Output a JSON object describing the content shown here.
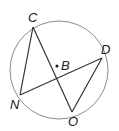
{
  "diagram": {
    "type": "circle-inscribed-chords",
    "circle": {
      "cx": 59,
      "cy": 70,
      "r": 49,
      "stroke": "#888888"
    },
    "center": {
      "label": "B",
      "x": 57,
      "y": 66
    },
    "points": [
      {
        "label": "C",
        "x": 33,
        "y": 27
      },
      {
        "label": "D",
        "x": 102,
        "y": 58
      },
      {
        "label": "N",
        "x": 20,
        "y": 95
      },
      {
        "label": "O",
        "x": 72,
        "y": 112
      }
    ],
    "segments": [
      [
        "C",
        "N"
      ],
      [
        "C",
        "O"
      ],
      [
        "N",
        "D"
      ],
      [
        "D",
        "O"
      ]
    ],
    "line_color": "#333333"
  }
}
